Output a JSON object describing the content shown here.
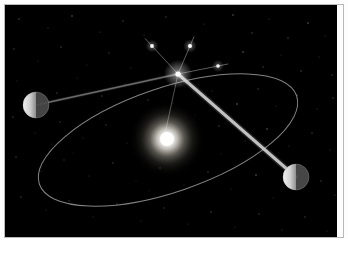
{
  "figure": {
    "caption": "",
    "background_color": "#000000",
    "page_color": "#ffffff",
    "border_color": "#b9b9b9",
    "width": 348,
    "height": 258
  },
  "sky": {
    "x": 5,
    "y": 5,
    "width": 332,
    "height": 232,
    "color": "#000000"
  },
  "sun": {
    "label": "Sun",
    "cx": 162,
    "cy": 134,
    "core_radius": 7,
    "glow_radius": 38,
    "core_color": "#ffffff",
    "glow_color": "#fff8e8"
  },
  "orbit": {
    "label": "Earth orbit",
    "cx": 163,
    "cy": 135,
    "rx": 136,
    "ry": 52,
    "rotation_deg": -19,
    "stroke_color": "#9a9a9a",
    "stroke_width": 1
  },
  "planets": [
    {
      "label": "Earth (position A - six months earlier)",
      "cx": 31,
      "cy": 100,
      "radius": 13,
      "lit_side": "left",
      "lit_color": "#f2f2f2",
      "dark_color": "#4a4a4a"
    },
    {
      "label": "Earth (position B - six months later)",
      "cx": 291,
      "cy": 172,
      "radius": 13,
      "lit_side": "left",
      "lit_color": "#f4f4f4",
      "dark_color": "#4c4c4c"
    }
  ],
  "target_star": {
    "label": "Nearby star",
    "cx": 173,
    "cy": 69,
    "core_radius": 2.6,
    "spike_length": 46,
    "color": "#ffffff"
  },
  "background_stars": [
    {
      "label": "reference star 1",
      "cx": 147,
      "cy": 41,
      "radius": 1.9,
      "brightness": 0.95
    },
    {
      "label": "reference star 2",
      "cx": 185,
      "cy": 41,
      "radius": 2.0,
      "brightness": 1.0
    },
    {
      "label": "reference star 3",
      "cx": 213,
      "cy": 61,
      "radius": 1.8,
      "brightness": 0.9
    }
  ],
  "sight_lines": [
    {
      "label": "line of sight from Earth position A to star",
      "x1": 31,
      "y1": 100,
      "x2": 173,
      "y2": 69,
      "stroke_color": "#8e8e8e",
      "stroke_width": 1.4
    },
    {
      "label": "line of sight from Earth position B to star",
      "x1": 291,
      "y1": 172,
      "x2": 173,
      "y2": 69,
      "stroke_color": "#cfcfcf",
      "stroke_width": 3.0
    }
  ],
  "projection_lines": [
    {
      "label": "apparent direction toward reference star 1",
      "x1": 173,
      "y1": 69,
      "x2": 147,
      "y2": 41,
      "stroke_color": "#7e7e7e",
      "stroke_width": 1.0
    },
    {
      "label": "apparent direction toward reference star 2",
      "x1": 173,
      "y1": 69,
      "x2": 185,
      "y2": 41,
      "stroke_color": "#7e7e7e",
      "stroke_width": 1.0
    },
    {
      "label": "apparent direction toward reference star 3",
      "x1": 173,
      "y1": 69,
      "x2": 213,
      "y2": 61,
      "stroke_color": "#7e7e7e",
      "stroke_width": 1.0
    },
    {
      "label": "sightline continuing down toward the Sun",
      "x1": 173,
      "y1": 69,
      "x2": 161,
      "y2": 124,
      "stroke_color": "#6f6f6f",
      "stroke_width": 1.0
    }
  ],
  "starfield": {
    "label": "background star field",
    "count": 86,
    "color": "#d8d8d8",
    "points": [
      [
        14,
        14,
        0.7,
        0.4
      ],
      [
        43,
        23,
        0.6,
        0.3
      ],
      [
        67,
        11,
        0.8,
        0.45
      ],
      [
        95,
        27,
        0.6,
        0.28
      ],
      [
        118,
        16,
        0.7,
        0.35
      ],
      [
        139,
        30,
        0.6,
        0.26
      ],
      [
        161,
        12,
        0.7,
        0.32
      ],
      [
        199,
        19,
        0.6,
        0.3
      ],
      [
        228,
        10,
        0.8,
        0.42
      ],
      [
        247,
        28,
        0.7,
        0.36
      ],
      [
        264,
        14,
        0.6,
        0.25
      ],
      [
        283,
        33,
        0.7,
        0.38
      ],
      [
        303,
        18,
        0.8,
        0.44
      ],
      [
        320,
        31,
        0.6,
        0.27
      ],
      [
        9,
        44,
        0.7,
        0.33
      ],
      [
        33,
        56,
        0.6,
        0.24
      ],
      [
        56,
        42,
        0.7,
        0.36
      ],
      [
        82,
        60,
        0.6,
        0.22
      ],
      [
        104,
        48,
        0.7,
        0.3
      ],
      [
        126,
        63,
        0.6,
        0.26
      ],
      [
        238,
        47,
        0.8,
        0.46
      ],
      [
        258,
        62,
        0.7,
        0.34
      ],
      [
        276,
        50,
        0.6,
        0.23
      ],
      [
        296,
        66,
        0.7,
        0.37
      ],
      [
        314,
        52,
        0.6,
        0.28
      ],
      [
        327,
        70,
        0.7,
        0.31
      ],
      [
        12,
        76,
        0.6,
        0.25
      ],
      [
        52,
        88,
        0.7,
        0.35
      ],
      [
        72,
        73,
        0.6,
        0.21
      ],
      [
        97,
        91,
        0.7,
        0.33
      ],
      [
        120,
        79,
        0.6,
        0.27
      ],
      [
        143,
        95,
        0.7,
        0.29
      ],
      [
        207,
        86,
        0.6,
        0.24
      ],
      [
        232,
        99,
        0.8,
        0.47
      ],
      [
        253,
        84,
        0.7,
        0.32
      ],
      [
        271,
        101,
        0.6,
        0.23
      ],
      [
        292,
        90,
        0.7,
        0.38
      ],
      [
        312,
        104,
        0.6,
        0.26
      ],
      [
        328,
        93,
        0.7,
        0.3
      ],
      [
        8,
        112,
        0.7,
        0.34
      ],
      [
        30,
        128,
        0.6,
        0.22
      ],
      [
        55,
        117,
        0.7,
        0.31
      ],
      [
        78,
        133,
        0.6,
        0.25
      ],
      [
        101,
        120,
        0.7,
        0.28
      ],
      [
        122,
        138,
        0.6,
        0.23
      ],
      [
        214,
        121,
        0.7,
        0.36
      ],
      [
        240,
        136,
        0.6,
        0.24
      ],
      [
        262,
        124,
        0.8,
        0.43
      ],
      [
        284,
        141,
        0.6,
        0.27
      ],
      [
        307,
        128,
        0.7,
        0.33
      ],
      [
        325,
        145,
        0.6,
        0.25
      ],
      [
        11,
        152,
        0.7,
        0.32
      ],
      [
        36,
        166,
        0.6,
        0.23
      ],
      [
        59,
        155,
        0.7,
        0.29
      ],
      [
        84,
        171,
        0.6,
        0.26
      ],
      [
        108,
        158,
        0.7,
        0.35
      ],
      [
        131,
        176,
        0.6,
        0.21
      ],
      [
        155,
        163,
        0.7,
        0.3
      ],
      [
        179,
        180,
        0.6,
        0.24
      ],
      [
        203,
        167,
        0.7,
        0.33
      ],
      [
        226,
        184,
        0.6,
        0.22
      ],
      [
        251,
        170,
        0.8,
        0.45
      ],
      [
        316,
        176,
        0.7,
        0.31
      ],
      [
        330,
        190,
        0.6,
        0.26
      ],
      [
        16,
        192,
        0.7,
        0.34
      ],
      [
        41,
        205,
        0.6,
        0.23
      ],
      [
        64,
        196,
        0.7,
        0.28
      ],
      [
        88,
        212,
        0.6,
        0.25
      ],
      [
        112,
        199,
        0.7,
        0.32
      ],
      [
        136,
        216,
        0.6,
        0.21
      ],
      [
        159,
        203,
        0.7,
        0.29
      ],
      [
        183,
        219,
        0.6,
        0.24
      ],
      [
        206,
        207,
        0.7,
        0.36
      ],
      [
        230,
        222,
        0.6,
        0.22
      ],
      [
        254,
        209,
        0.7,
        0.3
      ],
      [
        277,
        225,
        0.6,
        0.27
      ],
      [
        300,
        212,
        0.7,
        0.33
      ],
      [
        322,
        226,
        0.6,
        0.23
      ],
      [
        47,
        139,
        0.6,
        0.2
      ],
      [
        68,
        148,
        0.5,
        0.18
      ],
      [
        92,
        106,
        0.5,
        0.19
      ],
      [
        168,
        98,
        0.5,
        0.22
      ],
      [
        190,
        110,
        0.5,
        0.2
      ],
      [
        216,
        149,
        0.5,
        0.19
      ],
      [
        144,
        186,
        0.5,
        0.18
      ],
      [
        268,
        193,
        0.5,
        0.21
      ]
    ]
  }
}
